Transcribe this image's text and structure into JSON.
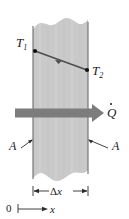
{
  "figure": {
    "colors": {
      "slab_fill": "#c9c9c9",
      "slab_edge": "#6b6b6b",
      "heat_arrow": "#7c7c7c",
      "ink": "#1a1a1a",
      "background": "#ffffff"
    },
    "labels": {
      "t1": "T",
      "t1_sub": "1",
      "t2": "T",
      "t2_sub": "2",
      "qdot": "Q",
      "area_left": "A",
      "area_right": "A",
      "thickness_delta": "Δ",
      "thickness_var": "x",
      "origin": "0",
      "axis_x": "x"
    },
    "geometry": {
      "slab_left_x": 33,
      "slab_right_x": 88,
      "slab_top_y": 16,
      "slab_bottom_y": 181,
      "heat_arrow_y": 113,
      "heat_arrow_start_x": 15,
      "heat_arrow_end_x": 104,
      "gradient_line_start": [
        35,
        51
      ],
      "gradient_line_end": [
        87,
        70
      ],
      "dimension_line_y": 191,
      "axis_line_y": 209
    },
    "annotations": {
      "gradient_arrow_direction": "toward-T1",
      "heat_flow_direction": "left-to-right",
      "wall_edges": "torn-wavy-top-and-bottom"
    }
  }
}
